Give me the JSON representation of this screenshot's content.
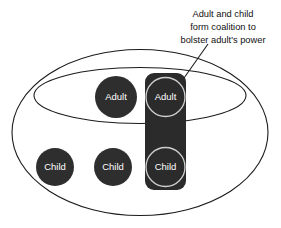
{
  "diagram": {
    "title_annotation": {
      "lines": [
        "Adult and child",
        "form coalition to",
        "bolster adult's power"
      ],
      "line1": "Adult and child",
      "line2": "form coalition to",
      "line3": "bolster adult's power"
    },
    "boundaries": [
      {
        "name": "family-system-boundary",
        "shape": "ellipse"
      },
      {
        "name": "parental-subsystem-boundary",
        "shape": "ellipse"
      }
    ],
    "coalition": {
      "name": "adult-child-coalition",
      "members": [
        "Adult",
        "Child"
      ]
    },
    "members": [
      {
        "id": "adult-left",
        "label": "Adult",
        "in_coalition": false,
        "in_subsystem": true
      },
      {
        "id": "adult-coalition",
        "label": "Adult",
        "in_coalition": true,
        "in_subsystem": true
      },
      {
        "id": "child-left",
        "label": "Child",
        "in_coalition": false,
        "in_subsystem": false
      },
      {
        "id": "child-middle",
        "label": "Child",
        "in_coalition": false,
        "in_subsystem": false
      },
      {
        "id": "child-coalition",
        "label": "Child",
        "in_coalition": true,
        "in_subsystem": false
      }
    ],
    "labels": {
      "adult_left": "Adult",
      "adult_coalition": "Adult",
      "child_left": "Child",
      "child_middle": "Child",
      "child_coalition": "Child"
    },
    "colors": {
      "background": "#ffffff",
      "line": "#1c1c1c",
      "node_fill": "#2e2e2e",
      "coalition_fill": "#2b2b2b",
      "node_ring": "#cfcfcf",
      "node_text": "#ffffff",
      "annotation_text": "#111111"
    }
  }
}
